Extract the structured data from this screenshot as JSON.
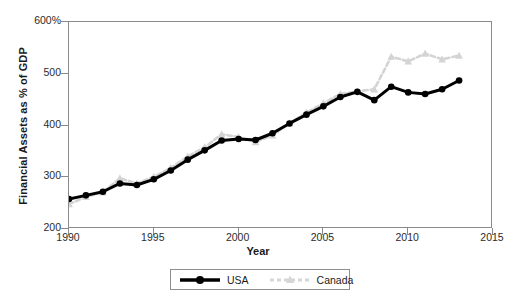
{
  "chart_data": {
    "type": "line",
    "title": "",
    "xlabel": "Year",
    "ylabel": "Financial Assets as % of GDP",
    "xlim": [
      1990,
      2015
    ],
    "ylim": [
      200,
      600
    ],
    "xticks": [
      "1990",
      "1995",
      "2000",
      "2005",
      "2010",
      "2015"
    ],
    "yticks": [
      "200",
      "300",
      "400",
      "500",
      "600%"
    ],
    "grid": false,
    "legend_position": "bottom-center",
    "x": [
      1990,
      1991,
      1992,
      1993,
      1994,
      1995,
      1996,
      1997,
      1998,
      1999,
      2000,
      2001,
      2002,
      2003,
      2004,
      2005,
      2006,
      2007,
      2008,
      2009,
      2010,
      2011,
      2012,
      2013
    ],
    "series": [
      {
        "name": "USA",
        "color": "#000000",
        "marker": "circle",
        "linestyle": "solid",
        "values": [
          258,
          265,
          272,
          288,
          285,
          296,
          313,
          334,
          352,
          371,
          374,
          372,
          385,
          404,
          421,
          437,
          455,
          465,
          449,
          475,
          464,
          461,
          470,
          487
        ]
      },
      {
        "name": "Canada",
        "color": "#d4d4d4",
        "marker": "triangle",
        "linestyle": "dashed",
        "values": [
          248,
          262,
          271,
          298,
          288,
          301,
          318,
          340,
          358,
          383,
          378,
          368,
          381,
          404,
          425,
          443,
          461,
          466,
          470,
          533,
          524,
          539,
          528,
          535
        ]
      }
    ]
  },
  "legend": {
    "items": [
      {
        "label": "USA"
      },
      {
        "label": "Canada"
      }
    ]
  }
}
